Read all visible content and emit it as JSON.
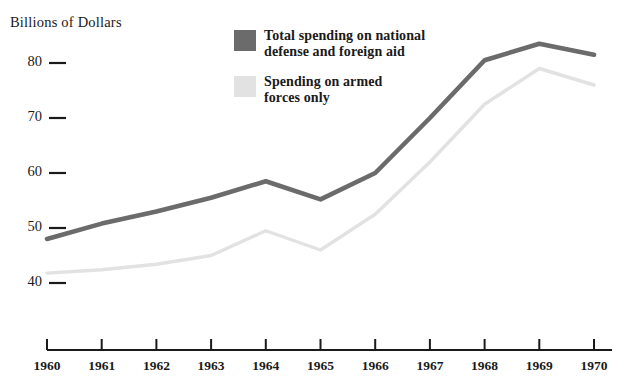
{
  "chart_data": {
    "type": "line",
    "title": "Billions of Dollars",
    "xlabel": "",
    "ylabel": "Billions of Dollars",
    "categories": [
      "1960",
      "1961",
      "1962",
      "1963",
      "1964",
      "1965",
      "1966",
      "1967",
      "1968",
      "1969",
      "1970"
    ],
    "x": [
      1960,
      1961,
      1962,
      1963,
      1964,
      1965,
      1966,
      1967,
      1968,
      1969,
      1970
    ],
    "xlim": [
      1960,
      1970
    ],
    "ylim": [
      36,
      86
    ],
    "yticks": [
      40,
      50,
      60,
      70,
      80
    ],
    "ytick_labels": [
      "40",
      "50",
      "60",
      "70",
      "80"
    ],
    "grid": false,
    "legend_position": "top-center",
    "series": [
      {
        "name": "Total spending on national defense and foreign aid",
        "color": "#6b6b6b",
        "values": [
          48.0,
          50.8,
          53.0,
          55.5,
          58.5,
          55.2,
          60.0,
          70.0,
          80.5,
          83.5,
          81.5
        ]
      },
      {
        "name": "Spending on armed forces only",
        "color": "#e2e2e2",
        "values": [
          41.8,
          42.4,
          43.4,
          45.0,
          49.5,
          46.0,
          52.5,
          62.0,
          72.5,
          79.0,
          76.0
        ]
      }
    ]
  },
  "axis": {
    "y_title": "Billions of Dollars"
  },
  "legend": {
    "items": [
      {
        "swatch_color": "#6b6b6b",
        "line1": "Total spending on national",
        "line2": "defense and foreign aid"
      },
      {
        "swatch_color": "#e2e2e2",
        "line1": "Spending on armed",
        "line2": "forces only"
      }
    ]
  },
  "colors": {
    "series_dark": "#6b6b6b",
    "series_light": "#e2e2e2",
    "axis": "#1a1a1a",
    "text": "#1a1a1a",
    "background": "#ffffff"
  }
}
